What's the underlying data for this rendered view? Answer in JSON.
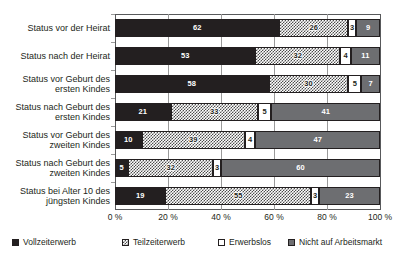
{
  "chart_data": {
    "type": "bar",
    "orientation": "horizontal",
    "stacked": true,
    "stack_mode": "percent",
    "title": "",
    "subtitle": "",
    "xlabel": "",
    "ylabel": "",
    "xlim": [
      0,
      100
    ],
    "xticks": [
      0,
      20,
      40,
      60,
      80,
      100
    ],
    "xtick_labels": [
      "0 %",
      "20 %",
      "40 %",
      "60 %",
      "80 %",
      "100 %"
    ],
    "grid": true,
    "grid_axis": "x",
    "legend_position": "bottom",
    "categories": [
      "Status vor der Heirat",
      "Status nach der Heirat",
      "Status vor Geburt des ersten Kindes",
      "Status nach Geburt des ersten Kindes",
      "Status vor Geburt des zweiten Kindes",
      "Status nach Geburt des zweiten Kindes",
      "Status bei Alter 10 des jüngsten Kindes"
    ],
    "category_lines": [
      [
        "Status vor der Heirat"
      ],
      [
        "Status nach der Heirat"
      ],
      [
        "Status vor Geburt des",
        "ersten Kindes"
      ],
      [
        "Status nach Geburt des",
        "ersten Kindes"
      ],
      [
        "Status vor Geburt des",
        "zweiten Kindes"
      ],
      [
        "Status nach Geburt des",
        "zweiten Kindes"
      ],
      [
        "Status bei Alter 10 des",
        "jüngsten Kindes"
      ]
    ],
    "series": [
      {
        "name": "Vollzeiterwerb",
        "key": "full",
        "color": "#231f20",
        "pattern": "solid",
        "values": [
          62,
          53,
          58,
          21,
          10,
          5,
          19
        ]
      },
      {
        "name": "Teilzeiterwerb",
        "key": "part",
        "color": "#4d4d4d",
        "pattern": "dotted",
        "values": [
          26,
          32,
          30,
          33,
          39,
          32,
          55
        ]
      },
      {
        "name": "Erwerbslos",
        "key": "unemployed",
        "color": "#ffffff",
        "pattern": "empty",
        "values": [
          3,
          4,
          5,
          5,
          4,
          3,
          3
        ]
      },
      {
        "name": "Nicht auf Arbeitsmarkt",
        "key": "inactive",
        "color": "#6d6e71",
        "pattern": "solid",
        "values": [
          9,
          11,
          7,
          41,
          47,
          60,
          23
        ]
      }
    ]
  },
  "legend": {
    "items": [
      {
        "label": "Vollzeiterwerb",
        "key": "full"
      },
      {
        "label": "Teilzeiterwerb",
        "key": "part"
      },
      {
        "label": "Erwerbslos",
        "key": "unemployed"
      },
      {
        "label": "Nicht auf Arbeitsmarkt",
        "key": "inactive"
      }
    ]
  }
}
